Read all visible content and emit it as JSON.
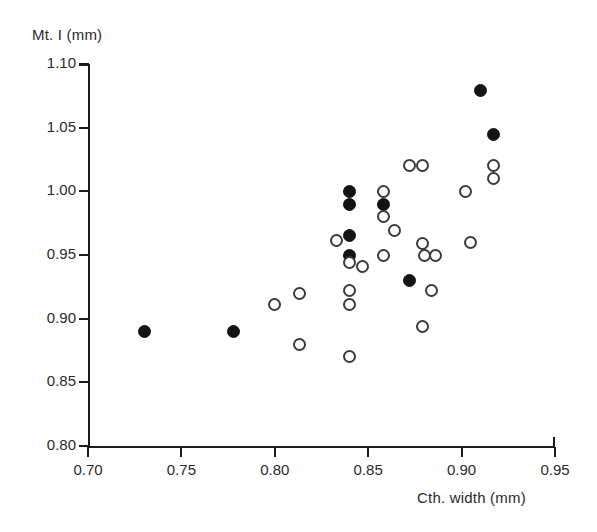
{
  "chart_data": {
    "type": "scatter",
    "title": "",
    "xlabel": "Cth. width (mm)",
    "ylabel": "Mt. I (mm)",
    "xlim": [
      0.7,
      0.95
    ],
    "ylim": [
      0.8,
      1.1
    ],
    "xticks": [
      "0.70",
      "0.75",
      "0.80",
      "0.85",
      "0.90",
      "0.95"
    ],
    "xtick_values": [
      0.7,
      0.75,
      0.8,
      0.85,
      0.9,
      0.95
    ],
    "yticks": [
      "0.80",
      "0.85",
      "0.90",
      "0.95",
      "1.00",
      "1.05",
      "1.10"
    ],
    "ytick_values": [
      0.8,
      0.85,
      0.9,
      0.95,
      1.0,
      1.05,
      1.1
    ],
    "grid": false,
    "legend": "none",
    "marker_size_px": 13,
    "series": [
      {
        "name": "filled-circles",
        "marker": "filled-circle",
        "color": "#141414",
        "points": [
          [
            0.73,
            0.89
          ],
          [
            0.778,
            0.89
          ],
          [
            0.84,
            1.0
          ],
          [
            0.84,
            0.99
          ],
          [
            0.84,
            0.965
          ],
          [
            0.84,
            0.95
          ],
          [
            0.858,
            0.99
          ],
          [
            0.872,
            0.93
          ],
          [
            0.91,
            1.079
          ],
          [
            0.917,
            1.045
          ]
        ]
      },
      {
        "name": "open-circles",
        "marker": "open-circle",
        "color": "#ffffff",
        "edge_color": "#3a3a3a",
        "points": [
          [
            0.8,
            0.911
          ],
          [
            0.813,
            0.92
          ],
          [
            0.813,
            0.88
          ],
          [
            0.833,
            0.961
          ],
          [
            0.84,
            0.944
          ],
          [
            0.84,
            0.922
          ],
          [
            0.84,
            0.911
          ],
          [
            0.84,
            0.87
          ],
          [
            0.847,
            0.941
          ],
          [
            0.858,
            1.0
          ],
          [
            0.858,
            0.98
          ],
          [
            0.858,
            0.95
          ],
          [
            0.864,
            0.969
          ],
          [
            0.872,
            1.02
          ],
          [
            0.879,
            1.02
          ],
          [
            0.879,
            0.959
          ],
          [
            0.879,
            0.894
          ],
          [
            0.88,
            0.95
          ],
          [
            0.886,
            0.95
          ],
          [
            0.884,
            0.922
          ],
          [
            0.902,
            1.0
          ],
          [
            0.905,
            0.96
          ],
          [
            0.917,
            1.02
          ],
          [
            0.917,
            1.01
          ]
        ]
      }
    ]
  }
}
